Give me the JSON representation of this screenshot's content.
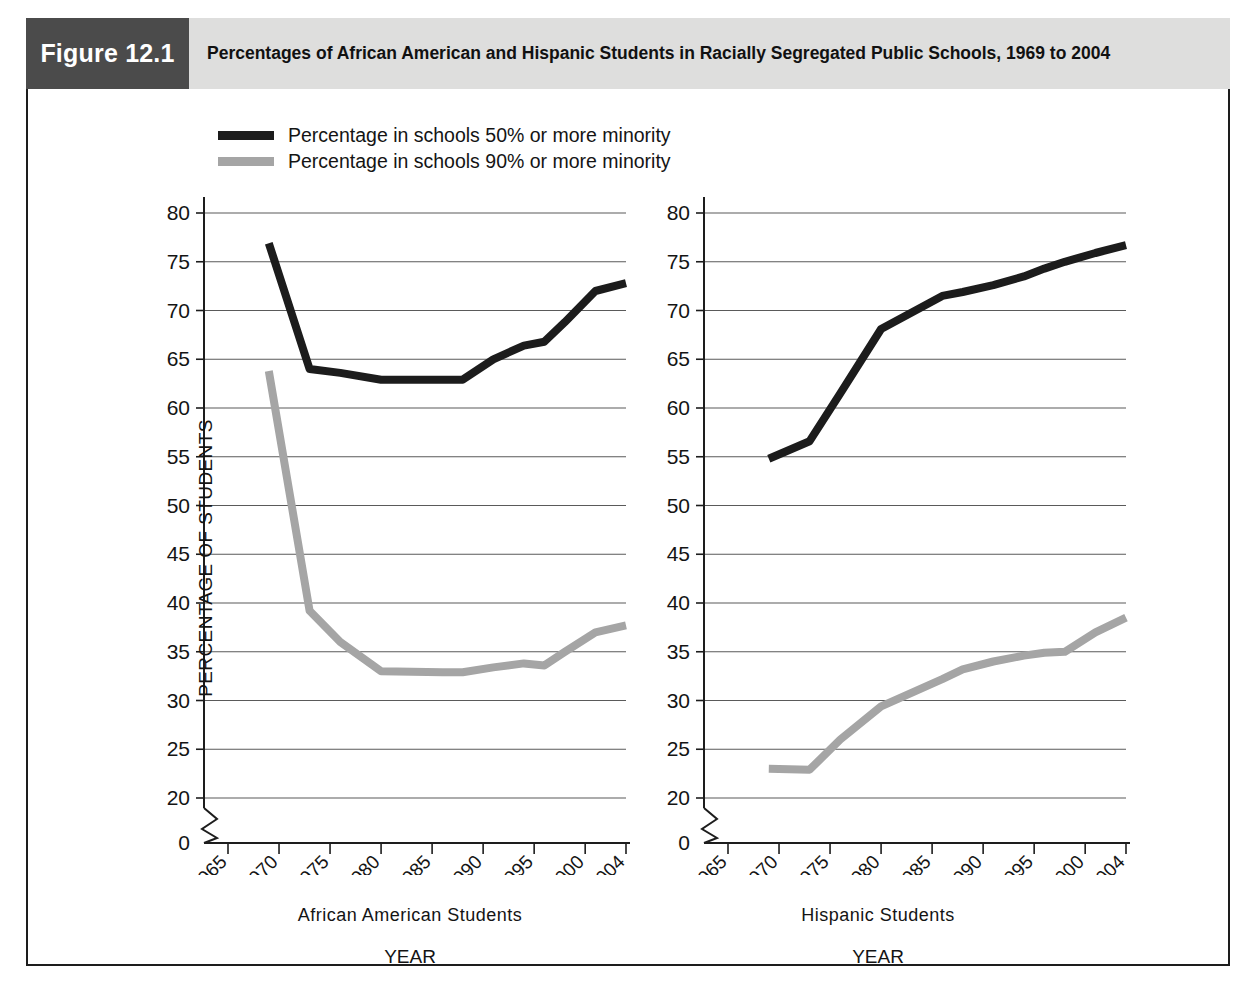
{
  "figure": {
    "badge": "Figure 12.1",
    "title": "Percentages of African American and Hispanic Students in Racially Segregated Public Schools, 1969 to 2004",
    "badge_color": "#4b4b4b",
    "title_bar_color": "#dededd",
    "frame_color": "#1d1d1d"
  },
  "legend": {
    "items": [
      {
        "label": "Percentage in schools 50% or more minority",
        "color": "#1c1c1c"
      },
      {
        "label": "Percentage in schools 90% or more minority",
        "color": "#a5a5a5"
      }
    ]
  },
  "axes": {
    "ylabel": "PERCENTAGE OF STUDENTS",
    "xlabel": "YEAR",
    "y_ticks": [
      "80",
      "75",
      "70",
      "65",
      "60",
      "55",
      "50",
      "45",
      "40",
      "35",
      "30",
      "25",
      "20",
      "0"
    ],
    "x_ticks": [
      "1965",
      "1970",
      "1975",
      "1980",
      "1985",
      "1990",
      "1995",
      "2000",
      "2004"
    ],
    "ylim": [
      20,
      80
    ],
    "xlim": [
      1965,
      2004
    ],
    "axis_break": true,
    "grid": "horizontal"
  },
  "panels": [
    {
      "name": "african-american",
      "subtitle": "African American Students",
      "xlabel": "YEAR"
    },
    {
      "name": "hispanic",
      "subtitle": "Hispanic Students",
      "xlabel": "YEAR"
    }
  ],
  "chart_data": {
    "type": "line",
    "title": "Percentages of African American and Hispanic Students in Racially Segregated Public Schools, 1969 to 2004",
    "xlabel": "YEAR",
    "ylabel": "PERCENTAGE OF STUDENTS",
    "xlim": [
      1965,
      2004
    ],
    "ylim": [
      20,
      80
    ],
    "y_ticks": [
      20,
      25,
      30,
      35,
      40,
      45,
      50,
      55,
      60,
      65,
      70,
      75,
      80
    ],
    "x_ticks": [
      1965,
      1970,
      1975,
      1980,
      1985,
      1990,
      1995,
      2000,
      2004
    ],
    "grid": "horizontal gridlines only",
    "legend_position": "above plots, top-left",
    "axis_break_below": 20,
    "panels": [
      {
        "panel": "African American Students",
        "series": [
          {
            "name": "Percentage in schools 50% or more minority",
            "color": "#1c1c1c",
            "x": [
              1969,
              1973,
              1976,
              1980,
              1986,
              1988,
              1991,
              1994,
              1996,
              1998,
              2001,
              2004
            ],
            "values": [
              76.9,
              64.0,
              63.6,
              62.9,
              62.9,
              62.9,
              65.0,
              66.4,
              66.8,
              68.8,
              72.0,
              72.8
            ]
          },
          {
            "name": "Percentage in schools 90% or more minority",
            "color": "#a5a5a5",
            "x": [
              1969,
              1973,
              1976,
              1980,
              1986,
              1988,
              1991,
              1994,
              1996,
              1998,
              2001,
              2004
            ],
            "values": [
              63.8,
              39.2,
              36.0,
              33.0,
              32.9,
              32.9,
              33.4,
              33.8,
              33.6,
              35.0,
              37.0,
              37.7
            ]
          }
        ]
      },
      {
        "panel": "Hispanic Students",
        "series": [
          {
            "name": "Percentage in schools 50% or more minority",
            "color": "#1c1c1c",
            "x": [
              1969,
              1973,
              1976,
              1980,
              1986,
              1988,
              1991,
              1994,
              1996,
              1998,
              2001,
              2004
            ],
            "values": [
              54.8,
              56.6,
              61.5,
              68.1,
              71.5,
              71.9,
              72.6,
              73.5,
              74.3,
              75.0,
              75.9,
              76.7
            ]
          },
          {
            "name": "Percentage in schools 90% or more minority",
            "color": "#a5a5a5",
            "x": [
              1969,
              1973,
              1976,
              1980,
              1986,
              1988,
              1991,
              1994,
              1996,
              1998,
              2001,
              2004
            ],
            "values": [
              23.0,
              22.9,
              26.0,
              29.4,
              32.2,
              33.2,
              34.0,
              34.6,
              34.9,
              35.0,
              37.0,
              38.5
            ]
          }
        ]
      }
    ]
  }
}
